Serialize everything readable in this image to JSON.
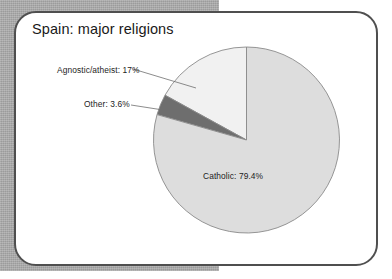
{
  "page": {
    "background_color": "#ffffff",
    "panel_color": "#a8a8a8"
  },
  "card": {
    "border_color": "#4f4f4f",
    "fill_color": "#ffffff"
  },
  "chart_data": {
    "type": "pie",
    "title": "Spain: major religions",
    "xlabel": "",
    "ylabel": "",
    "grid": false,
    "legend_position": "none",
    "start_angle_deg": 90,
    "direction": "counterclockwise",
    "categories": [
      "Agnostic/atheist",
      "Other",
      "Catholic"
    ],
    "values": [
      17,
      3.6,
      79.4
    ],
    "unit": "%",
    "labels": [
      "Agnostic/atheist: 17%",
      "Other: 3.6%",
      "Catholic: 79.4%"
    ],
    "colors": [
      "#f1f1f1",
      "#6e6e6e",
      "#dddddd"
    ],
    "slice_edge_color": "#8a8a8a",
    "label_placement": [
      "outside-leader",
      "outside-leader",
      "inside"
    ]
  },
  "labels": {
    "agnostic": "Agnostic/atheist: 17%",
    "other": "Other: 3.6%",
    "catholic": "Catholic: 79.4%"
  }
}
